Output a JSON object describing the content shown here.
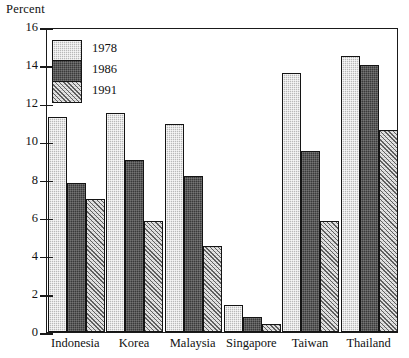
{
  "chart_data": {
    "type": "bar",
    "title": "",
    "xlabel": "",
    "ylabel": "Percent",
    "ylim": [
      0,
      16
    ],
    "yticks": [
      0,
      2,
      4,
      6,
      8,
      10,
      12,
      14,
      16
    ],
    "grid": false,
    "legend_position": "top-left",
    "categories": [
      "Indonesia",
      "Korea",
      "Malaysia",
      "Singapore",
      "Taiwan",
      "Thailand"
    ],
    "series": [
      {
        "name": "1978",
        "values": [
          11.3,
          11.5,
          10.9,
          1.4,
          13.6,
          14.5
        ]
      },
      {
        "name": "1986",
        "values": [
          7.8,
          9.0,
          8.2,
          0.8,
          9.5,
          14.0
        ]
      },
      {
        "name": "1991",
        "values": [
          7.0,
          5.8,
          4.5,
          0.4,
          5.8,
          10.6
        ]
      }
    ]
  },
  "axis": {
    "y_title": "Percent",
    "tick_labels": [
      "16",
      "14",
      "12",
      "10",
      "8",
      "6",
      "4",
      "2",
      "0"
    ]
  },
  "legend": {
    "items": [
      {
        "label": "1978",
        "pattern": "light-checker-swatch",
        "color": "#b9b9b9"
      },
      {
        "label": "1986",
        "pattern": "dark-solid-swatch",
        "color": "#3a3a3a"
      },
      {
        "label": "1991",
        "pattern": "diagonal-hatch-swatch",
        "color": "#cfcfcf"
      }
    ]
  }
}
